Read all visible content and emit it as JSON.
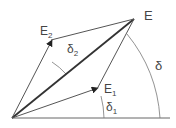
{
  "diagram": {
    "colors": {
      "line": "#555555",
      "bold_line": "#333333",
      "text": "#444444"
    },
    "points": {
      "origin": {
        "label": ""
      },
      "E": {
        "label": "E"
      },
      "E1": {
        "label": "E",
        "subscript": "1"
      },
      "E2": {
        "label": "E",
        "subscript": "2"
      }
    },
    "angles": {
      "delta": {
        "label": "δ"
      },
      "delta1": {
        "label": "δ",
        "subscript": "1"
      },
      "delta2": {
        "label": "δ",
        "subscript": "2"
      }
    }
  }
}
